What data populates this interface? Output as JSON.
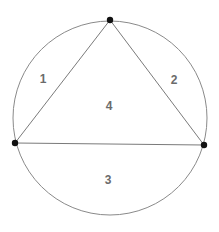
{
  "diagram": {
    "type": "inscribed-triangle-in-circle",
    "circle": {
      "cx": 110,
      "cy": 118,
      "r": 97,
      "stroke": "#8a8a8a"
    },
    "triangle": {
      "stroke": "#7a7a7a",
      "vertices": [
        {
          "name": "top",
          "x": 110,
          "y": 20
        },
        {
          "name": "left",
          "x": 15,
          "y": 143
        },
        {
          "name": "right",
          "x": 204,
          "y": 145
        }
      ]
    },
    "point_color": "#111111",
    "regions": [
      {
        "id": "1",
        "label": "1",
        "x": 43,
        "y": 83
      },
      {
        "id": "2",
        "label": "2",
        "x": 174,
        "y": 84
      },
      {
        "id": "3",
        "label": "3",
        "x": 108,
        "y": 184
      },
      {
        "id": "4",
        "label": "4",
        "x": 109,
        "y": 110
      }
    ]
  }
}
